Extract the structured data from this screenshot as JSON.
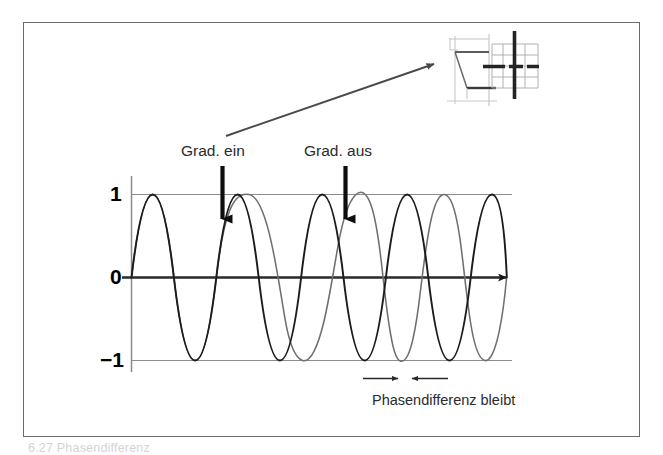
{
  "figure": {
    "frame": {
      "border_color": "#6a6a6a",
      "background": "#ffffff"
    },
    "caption_partial": "6.27 Phasendifferenz"
  },
  "plot": {
    "y_ticks": [
      {
        "name": "one",
        "label": "1"
      },
      {
        "name": "zero",
        "label": "0"
      },
      {
        "name": "neg-one",
        "label": "−1"
      }
    ],
    "gridline_color": "#8d8d8d",
    "axis_color": "#2a2a2a",
    "axis_arrow": "arrowhead-right",
    "curves": [
      {
        "name": "reference-spin",
        "role": "unshifted reference magnetization",
        "color": "#1c1c1c",
        "stroke_width": 1.9,
        "amplitude": 1,
        "period_units": 1.0,
        "phase_offset_deg": 0,
        "description": "constant-frequency sine, runs unchanged across the whole time axis"
      },
      {
        "name": "gradient-affected-spin",
        "role": "spin exposed to the gradient pulse",
        "color": "#6f6f6f",
        "stroke_width": 1.5,
        "amplitude": 1,
        "period_units_before_gradient": 1.0,
        "period_units_during_gradient": 1.62,
        "period_units_after_gradient": 1.0,
        "accumulated_phase_shift_deg": 138,
        "description": "identical to reference until Grad. ein; slowed while the gradient is on; resumes original frequency after Grad. aus but keeps the accumulated phase difference"
      }
    ]
  },
  "annotations": {
    "gradient_on": {
      "label": "Grad. ein",
      "marker": "down-arrow",
      "x_units": 2.0
    },
    "gradient_off": {
      "label": "Grad. aus",
      "marker": "down-arrow",
      "x_units": 4.8
    },
    "phase_difference": {
      "label": "Phasendifferenz bleibt",
      "left_arrow": "arrow-right",
      "right_arrow": "arrow-left"
    },
    "pointer_to_inset": {
      "name": "arrow-to-kspace-inset",
      "marker": "diagonal-arrow"
    }
  },
  "inset": {
    "name": "k-space-trajectory-inset",
    "description": "small schematic of k-space raster with highlighted central row and column",
    "grid_color": "#a9a9a9",
    "highlight_color": "#2b2b2b",
    "light_line_color": "#b9b9b9",
    "grid_columns": 5,
    "grid_rows": 4
  },
  "colors": {
    "ink": "#1c1c1c",
    "gray_curve": "#6f6f6f",
    "grid": "#8d8d8d",
    "frame": "#6a6a6a",
    "faint": "#d4d4d4"
  }
}
